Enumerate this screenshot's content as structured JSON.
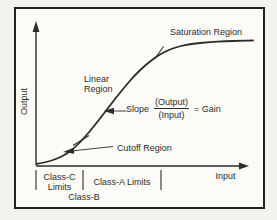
{
  "diagram": {
    "y_axis_label": "Output",
    "x_axis_label": "Input",
    "labels": {
      "saturation_region": "Saturation Region",
      "linear_region_line1": "Linear",
      "linear_region_line2": "Region",
      "cutoff_region": "Cutoff Region",
      "slope_prefix": "Slope",
      "slope_numerator": "(Output)",
      "slope_denominator": "(Input)",
      "slope_result": "= Gain",
      "class_c_line1": "Class-C",
      "class_c_line2": "Limits",
      "class_a": "Class-A Limits",
      "class_b": "Class-B"
    },
    "colors": {
      "ink": "#2e2c29",
      "paper": "#fcfbf8",
      "frame_border": "#23211e"
    },
    "curve": {
      "type": "amplifier-transfer-characteristic",
      "points": [
        [
          36,
          164
        ],
        [
          45,
          162.5
        ],
        [
          55,
          159.5
        ],
        [
          65,
          155
        ],
        [
          75,
          147.5
        ],
        [
          85,
          137
        ],
        [
          95,
          125
        ],
        [
          105,
          112
        ],
        [
          115,
          99
        ],
        [
          125,
          86.5
        ],
        [
          135,
          75
        ],
        [
          145,
          65.5
        ],
        [
          155,
          57.5
        ],
        [
          165,
          51.5
        ],
        [
          175,
          47.5
        ],
        [
          185,
          45
        ],
        [
          195,
          43.5
        ],
        [
          210,
          42
        ],
        [
          225,
          41.2
        ],
        [
          240,
          40.8
        ],
        [
          253,
          40.5
        ]
      ]
    },
    "curve_boundary_ticks": [
      [
        73,
        145.5,
        89,
        135.5
      ],
      [
        154.5,
        59,
        163.5,
        46.5
      ]
    ],
    "axis_divider_ticks_x": [
      36,
      83,
      161
    ]
  }
}
